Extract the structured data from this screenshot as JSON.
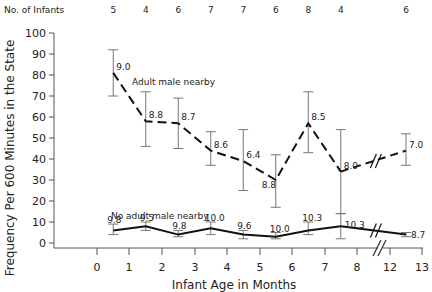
{
  "chart_data": {
    "type": "line",
    "title": "",
    "xlabel": "Infant Age in Months",
    "ylabel": "Frequency Per 600 Minutes in the State",
    "ylim": [
      0,
      100
    ],
    "yticks": [
      0,
      10,
      20,
      30,
      40,
      50,
      60,
      70,
      80,
      90,
      100
    ],
    "xticks": [
      "0",
      "1",
      "2",
      "3",
      "4",
      "5",
      "6",
      "7",
      "8",
      "12",
      "13"
    ],
    "top_label": "No. of Infants",
    "n_infants": [
      "5",
      "4",
      "6",
      "7",
      "7",
      "6",
      "8",
      "4",
      "6"
    ],
    "x": [
      0.5,
      1.5,
      2.5,
      3.5,
      4.5,
      5.5,
      6.5,
      7.5,
      12.5
    ],
    "axis_break": "between 8 and 12",
    "series": [
      {
        "name": "Adult male nearby",
        "style": "dashed",
        "values": [
          81,
          58,
          57,
          44,
          39,
          30,
          57,
          34,
          44
        ],
        "err_low": [
          70,
          46,
          45,
          37,
          25,
          17,
          43,
          14,
          37
        ],
        "err_high": [
          92,
          72,
          69,
          53,
          54,
          42,
          72,
          54,
          52
        ],
        "point_labels": [
          "9.0",
          "8.8",
          "8.7",
          "8.6",
          "6.4",
          "8.8",
          "8.5",
          "8.0",
          "7.0"
        ]
      },
      {
        "name": "No adult male nearby",
        "style": "solid",
        "values": [
          6,
          8,
          4,
          7,
          4,
          3,
          6,
          8,
          4
        ],
        "err_low": [
          4,
          6,
          3,
          4,
          2,
          2,
          4,
          2,
          3
        ],
        "err_high": [
          9,
          10,
          6,
          10,
          6,
          5,
          10,
          14,
          5
        ],
        "point_labels": [
          "9.8",
          "9.5",
          "9.8",
          "10.0",
          "9.6",
          "10.0",
          "10.3",
          "10.3",
          "8.7"
        ]
      }
    ],
    "grid": false,
    "legend": "inline labels"
  }
}
